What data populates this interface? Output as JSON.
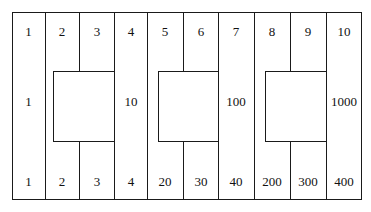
{
  "diagram": {
    "top_row": [
      "1",
      "2",
      "3",
      "4",
      "5",
      "6",
      "7",
      "8",
      "9",
      "10"
    ],
    "middle_row": {
      "col1": "1",
      "col4": "10",
      "col7": "100",
      "col10": "1000"
    },
    "bottom_row": [
      "1",
      "2",
      "3",
      "4",
      "20",
      "30",
      "40",
      "200",
      "300",
      "400"
    ],
    "inner_boxes": [
      {
        "spans_columns": [
          2,
          3
        ]
      },
      {
        "spans_columns": [
          5,
          6
        ]
      },
      {
        "spans_columns": [
          8,
          9
        ]
      }
    ],
    "colors": {
      "line": "#1a1a1a",
      "background": "#ffffff",
      "text": "#111111"
    }
  }
}
